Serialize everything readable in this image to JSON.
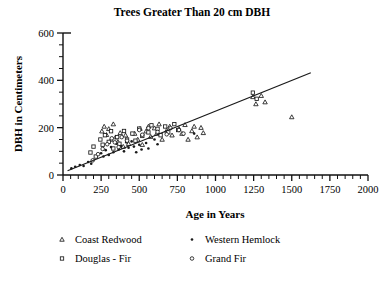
{
  "chart_data": {
    "type": "scatter",
    "title": "Trees Greater Than 20 cm DBH",
    "xlabel": "Age in Years",
    "ylabel": "DBH in Centimeters",
    "xlim": [
      0,
      2000
    ],
    "ylim": [
      0,
      600
    ],
    "xticks": [
      0,
      250,
      500,
      750,
      1000,
      1250,
      1500,
      1750,
      2000
    ],
    "xtick_labels": [
      "0",
      "250",
      "500",
      "750",
      "1000",
      "1250",
      "1500",
      "1750",
      "2000"
    ],
    "xminor_step": 50,
    "yticks": [
      0,
      200,
      400,
      600
    ],
    "ytick_labels": [
      "0",
      "200",
      "400",
      "600"
    ],
    "yminor_step": 50,
    "grid": false,
    "legend_position": "below-plot",
    "marker_color": "#1a1a1a",
    "line_color": "#1a1a1a",
    "trendline": {
      "name": "linear fit",
      "x": [
        30,
        1625
      ],
      "y": [
        18,
        432
      ]
    },
    "series": [
      {
        "name": "Coast Redwood",
        "marker": "open-triangle",
        "points": [
          [
            255,
            185
          ],
          [
            270,
            205
          ],
          [
            285,
            170
          ],
          [
            300,
            195
          ],
          [
            315,
            150
          ],
          [
            330,
            215
          ],
          [
            345,
            160
          ],
          [
            360,
            140
          ],
          [
            375,
            178
          ],
          [
            395,
            120
          ],
          [
            410,
            168
          ],
          [
            430,
            132
          ],
          [
            470,
            175
          ],
          [
            490,
            150
          ],
          [
            505,
            196
          ],
          [
            520,
            128
          ],
          [
            545,
            185
          ],
          [
            560,
            205
          ],
          [
            575,
            162
          ],
          [
            600,
            198
          ],
          [
            615,
            175
          ],
          [
            630,
            215
          ],
          [
            650,
            150
          ],
          [
            680,
            188
          ],
          [
            700,
            205
          ],
          [
            715,
            168
          ],
          [
            760,
            196
          ],
          [
            780,
            175
          ],
          [
            800,
            212
          ],
          [
            820,
            150
          ],
          [
            845,
            186
          ],
          [
            860,
            205
          ],
          [
            880,
            160
          ],
          [
            905,
            200
          ],
          [
            920,
            178
          ],
          [
            1245,
            330
          ],
          [
            1265,
            300
          ],
          [
            1300,
            335
          ],
          [
            1325,
            308
          ],
          [
            1500,
            245
          ]
        ]
      },
      {
        "name": "Douglas - Fir",
        "marker": "open-square",
        "points": [
          [
            180,
            95
          ],
          [
            200,
            120
          ],
          [
            215,
            78
          ],
          [
            245,
            150
          ],
          [
            260,
            128
          ],
          [
            275,
            168
          ],
          [
            300,
            140
          ],
          [
            315,
            185
          ],
          [
            330,
            112
          ],
          [
            355,
            160
          ],
          [
            370,
            132
          ],
          [
            400,
            186
          ],
          [
            420,
            150
          ],
          [
            455,
            175
          ],
          [
            475,
            145
          ],
          [
            500,
            196
          ],
          [
            520,
            165
          ],
          [
            560,
            180
          ],
          [
            580,
            210
          ],
          [
            620,
            195
          ],
          [
            640,
            168
          ],
          [
            670,
            205
          ],
          [
            690,
            180
          ],
          [
            730,
            215
          ],
          [
            755,
            190
          ],
          [
            1245,
            348
          ],
          [
            1270,
            322
          ]
        ]
      },
      {
        "name": "Western Hemlock",
        "marker": "filled-dot",
        "points": [
          [
            55,
            28
          ],
          [
            80,
            35
          ],
          [
            110,
            42
          ],
          [
            135,
            38
          ],
          [
            165,
            55
          ],
          [
            185,
            48
          ],
          [
            250,
            92
          ],
          [
            265,
            78
          ],
          [
            280,
            105
          ],
          [
            300,
            85
          ],
          [
            315,
            118
          ],
          [
            330,
            96
          ],
          [
            350,
            132
          ],
          [
            365,
            108
          ],
          [
            380,
            122
          ],
          [
            400,
            100
          ],
          [
            415,
            138
          ],
          [
            430,
            115
          ],
          [
            450,
            142
          ],
          [
            465,
            120
          ],
          [
            480,
            96
          ],
          [
            500,
            128
          ],
          [
            515,
            108
          ],
          [
            545,
            135
          ],
          [
            560,
            112
          ],
          [
            600,
            150
          ],
          [
            620,
            130
          ],
          [
            860,
            175
          ]
        ]
      },
      {
        "name": "Grand Fir",
        "marker": "open-circle",
        "points": [
          [
            195,
            62
          ],
          [
            230,
            88
          ],
          [
            260,
            110
          ],
          [
            290,
            130
          ],
          [
            320,
            155
          ],
          [
            340,
            138
          ],
          [
            365,
            118
          ],
          [
            385,
            160
          ],
          [
            420,
            145
          ],
          [
            500,
            190
          ],
          [
            520,
            170
          ],
          [
            560,
            198
          ],
          [
            620,
            182
          ],
          [
            680,
            172
          ],
          [
            705,
            198
          ],
          [
            760,
            190
          ],
          [
            790,
            175
          ]
        ]
      }
    ]
  },
  "legend": {
    "entries": [
      {
        "label": "Coast Redwood",
        "marker": "open-triangle"
      },
      {
        "label": "Western Hemlock",
        "marker": "filled-dot"
      },
      {
        "label": "Douglas - Fir",
        "marker": "open-square"
      },
      {
        "label": "Grand Fir",
        "marker": "open-circle"
      }
    ]
  }
}
